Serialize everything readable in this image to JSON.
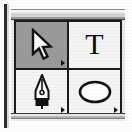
{
  "palette": {
    "name": "Toolbox",
    "title_bar_label": "",
    "selected_tool": "selection",
    "columns": 2,
    "rows": 2,
    "colors": {
      "selected_cell": "#9a9a9a",
      "cell": "#f4f4f4",
      "frame": "#1c1c1c",
      "glyph": "#0d0d0d",
      "panel": "#e9e9e9"
    },
    "tools": [
      {
        "id": "selection",
        "label": "Selection Tool",
        "icon": "arrow-cursor-icon",
        "selected": true,
        "has_flyout": true,
        "flyout_marker": "▸"
      },
      {
        "id": "type",
        "label": "Type Tool",
        "icon": "type-tool-icon",
        "glyph": "T",
        "selected": false,
        "has_flyout": false,
        "flyout_marker": ""
      },
      {
        "id": "pen",
        "label": "Pen Tool",
        "icon": "pen-nib-icon",
        "selected": false,
        "has_flyout": true,
        "flyout_marker": "▸"
      },
      {
        "id": "ellipse",
        "label": "Ellipse Tool",
        "icon": "ellipse-shape-icon",
        "selected": false,
        "has_flyout": true,
        "flyout_marker": "▸"
      }
    ]
  }
}
